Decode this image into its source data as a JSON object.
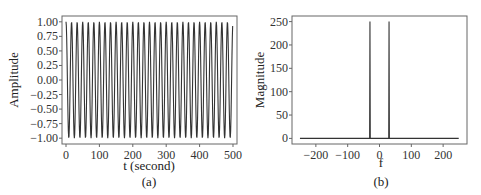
{
  "chart_data": [
    {
      "type": "line",
      "panel_label": "(a)",
      "title": "",
      "xlabel": "t (second)",
      "ylabel": "Amplitude",
      "xlim": [
        -12,
        512
      ],
      "ylim": [
        -1.1,
        1.1
      ],
      "xticks": [
        0,
        100,
        200,
        300,
        400,
        500
      ],
      "xtick_labels": [
        "0",
        "100",
        "200",
        "300",
        "400",
        "500"
      ],
      "yticks": [
        1.0,
        0.75,
        0.5,
        0.25,
        0.0,
        -0.25,
        -0.5,
        -0.75,
        -1.0
      ],
      "ytick_labels": [
        "1.00",
        "0.75",
        "0.50",
        "0.25",
        "0.00",
        "−0.25",
        "−0.50",
        "−0.75",
        "−1.00"
      ],
      "grid": false,
      "series": [
        {
          "name": "signal",
          "description": "cosine, 30 cycles over t = 0..499 s, amplitude 1",
          "function": "cos(2*pi*30*t/500)",
          "t_start": 0,
          "t_end": 499,
          "cycles": 30,
          "amplitude": 1.0,
          "color": "#333333"
        }
      ]
    },
    {
      "type": "line",
      "panel_label": "(b)",
      "title": "",
      "xlabel": "f",
      "ylabel": "Magnitude",
      "xlim": [
        -275,
        275
      ],
      "ylim": [
        -12,
        262
      ],
      "xticks": [
        -200,
        -100,
        0,
        100,
        200
      ],
      "xtick_labels": [
        "−200",
        "−100",
        "0",
        "100",
        "200"
      ],
      "yticks": [
        250,
        200,
        150,
        100,
        50,
        0
      ],
      "ytick_labels": [
        "250",
        "200",
        "150",
        "100",
        "50",
        "0"
      ],
      "grid": false,
      "series": [
        {
          "name": "spectrum",
          "description": "FFT magnitude: zero everywhere except spikes at f = ±30",
          "x_range": [
            -250,
            249
          ],
          "peaks": [
            {
              "f": -30,
              "magnitude": 250
            },
            {
              "f": 30,
              "magnitude": 250
            }
          ],
          "color": "#333333"
        }
      ]
    }
  ]
}
